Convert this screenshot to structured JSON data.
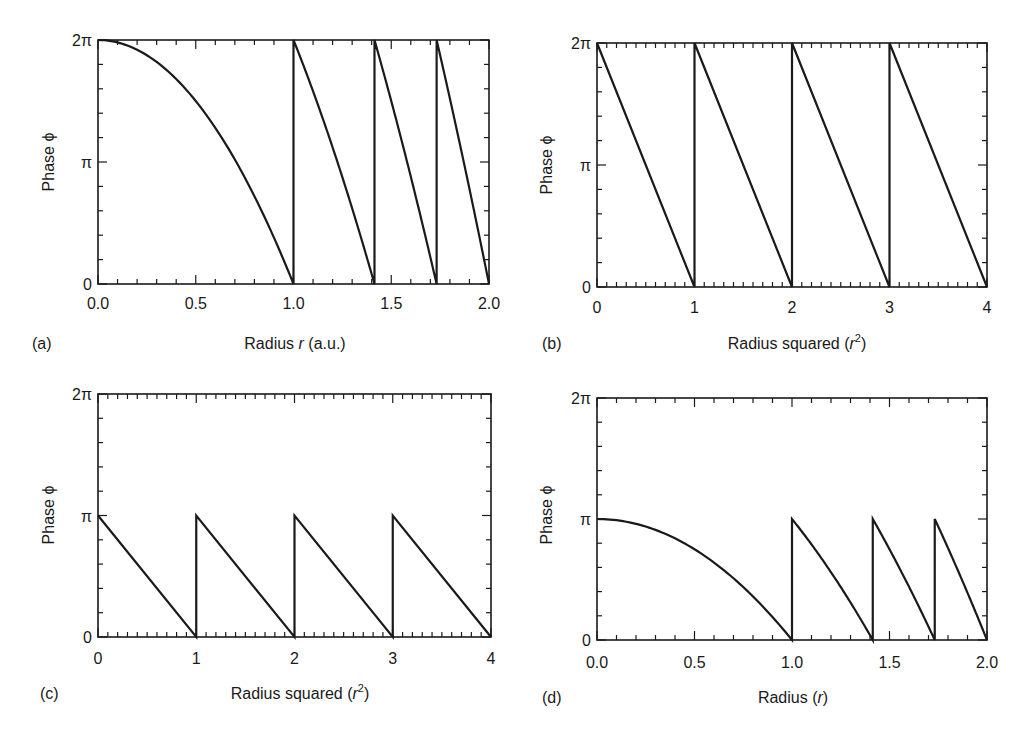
{
  "figure": {
    "panels": [
      {
        "id": "a",
        "label": "(a)",
        "xlabel_parts": [
          "Radius ",
          "r",
          " (a.u.)"
        ],
        "ylabel": "Phase ϕ",
        "xticks": [
          "0.0",
          "0.5",
          "1.0",
          "1.5",
          "2.0"
        ],
        "yticks": [
          "0",
          "π",
          "2π"
        ]
      },
      {
        "id": "b",
        "label": "(b)",
        "xlabel_parts": [
          "Radius squared (",
          "r",
          "2",
          ")"
        ],
        "ylabel": "Phase ϕ",
        "xticks": [
          "0",
          "1",
          "2",
          "3",
          "4"
        ],
        "yticks": [
          "0",
          "π",
          "2π"
        ]
      },
      {
        "id": "c",
        "label": "(c)",
        "xlabel_parts": [
          "Radius squared (",
          "r",
          "2",
          ")"
        ],
        "ylabel": "Phase ϕ",
        "xticks": [
          "0",
          "1",
          "2",
          "3",
          "4"
        ],
        "yticks": [
          "0",
          "π",
          "2π"
        ]
      },
      {
        "id": "d",
        "label": "(d)",
        "xlabel_parts": [
          "Radius  (",
          "r",
          ")"
        ],
        "ylabel": "Phase ϕ",
        "xticks": [
          "0.0",
          "0.5",
          "1.0",
          "1.5",
          "2.0"
        ],
        "yticks": [
          "0",
          "π",
          "2π"
        ]
      }
    ]
  },
  "chart_data": [
    {
      "panel": "(a)",
      "type": "line",
      "title": "",
      "xlabel": "Radius r (a.u.)",
      "ylabel": "Phase ϕ",
      "xlim": [
        0,
        2
      ],
      "ylim_in_pi": [
        0,
        2
      ],
      "xtick_values": [
        0,
        0.5,
        1.0,
        1.5,
        2.0
      ],
      "xtick_labels": [
        "0.0",
        "0.5",
        "1.0",
        "1.5",
        "2.0"
      ],
      "ytick_values_in_pi": [
        0,
        1,
        2
      ],
      "ytick_labels": [
        "0",
        "π",
        "2π"
      ],
      "minor_x_step": 0.1,
      "minor_y_step_in_pi": 0.2,
      "grid": false,
      "function": "phi = 2π·(ceil(r²) − r²) wrapped; first zone phi = 2π(1 − r²)",
      "series": [
        {
          "name": "phase",
          "x": [
            0,
            0.25,
            0.5,
            0.75,
            1.0,
            1.0,
            1.2,
            1.414,
            1.414,
            1.6,
            1.732,
            1.732,
            1.9,
            2.0
          ],
          "y_in_pi": [
            2,
            1.875,
            1.5,
            0.875,
            0,
            2,
            1.12,
            0,
            2,
            0.88,
            0,
            2,
            0.78,
            0
          ]
        }
      ],
      "discontinuities_x": [
        1.0,
        1.414,
        1.732
      ]
    },
    {
      "panel": "(b)",
      "type": "line",
      "title": "",
      "xlabel": "Radius squared (r²)",
      "ylabel": "Phase ϕ",
      "xlim": [
        0,
        4
      ],
      "ylim_in_pi": [
        0,
        2
      ],
      "xtick_values": [
        0,
        1,
        2,
        3,
        4
      ],
      "xtick_labels": [
        "0",
        "1",
        "2",
        "3",
        "4"
      ],
      "ytick_values_in_pi": [
        0,
        1,
        2
      ],
      "ytick_labels": [
        "0",
        "π",
        "2π"
      ],
      "minor_x_step": 0.1,
      "minor_y_step_in_pi": 0.2,
      "grid": false,
      "series": [
        {
          "name": "phase",
          "x": [
            0,
            1,
            1,
            2,
            2,
            3,
            3,
            4
          ],
          "y_in_pi": [
            2,
            0,
            2,
            0,
            2,
            0,
            2,
            0
          ]
        }
      ],
      "discontinuities_x": [
        1,
        2,
        3
      ]
    },
    {
      "panel": "(c)",
      "type": "line",
      "title": "",
      "xlabel": "Radius squared (r²)",
      "ylabel": "Phase ϕ",
      "xlim": [
        0,
        4
      ],
      "ylim_in_pi": [
        0,
        2
      ],
      "xtick_values": [
        0,
        1,
        2,
        3,
        4
      ],
      "xtick_labels": [
        "0",
        "1",
        "2",
        "3",
        "4"
      ],
      "ytick_values_in_pi": [
        0,
        1,
        2
      ],
      "ytick_labels": [
        "0",
        "π",
        "2π"
      ],
      "minor_x_step": 0.1,
      "minor_y_step_in_pi": 0.2,
      "grid": false,
      "series": [
        {
          "name": "phase",
          "x": [
            0,
            1,
            1,
            2,
            2,
            3,
            3,
            4
          ],
          "y_in_pi": [
            1,
            0,
            1,
            0,
            1,
            0,
            1,
            0
          ]
        }
      ],
      "discontinuities_x": [
        1,
        2,
        3
      ]
    },
    {
      "panel": "(d)",
      "type": "line",
      "title": "",
      "xlabel": "Radius (r)",
      "ylabel": "Phase ϕ",
      "xlim": [
        0,
        2
      ],
      "ylim_in_pi": [
        0,
        2
      ],
      "xtick_values": [
        0,
        0.5,
        1.0,
        1.5,
        2.0
      ],
      "xtick_labels": [
        "0.0",
        "0.5",
        "1.0",
        "1.5",
        "2.0"
      ],
      "ytick_values_in_pi": [
        0,
        1,
        2
      ],
      "ytick_labels": [
        "0",
        "π",
        "2π"
      ],
      "minor_x_step": 0.1,
      "minor_y_step_in_pi": 0.2,
      "grid": false,
      "function": "phi = π·(ceil(r²) − r²) wrapped; first zone phi = π(1 − r²)",
      "series": [
        {
          "name": "phase",
          "x": [
            0,
            0.25,
            0.5,
            0.75,
            1.0,
            1.0,
            1.2,
            1.414,
            1.414,
            1.6,
            1.732,
            1.732,
            1.9,
            2.0
          ],
          "y_in_pi": [
            1,
            0.9375,
            0.75,
            0.4375,
            0,
            1,
            0.56,
            0,
            1,
            0.44,
            0,
            1,
            0.39,
            0
          ]
        }
      ],
      "discontinuities_x": [
        1.0,
        1.414,
        1.732
      ]
    }
  ]
}
